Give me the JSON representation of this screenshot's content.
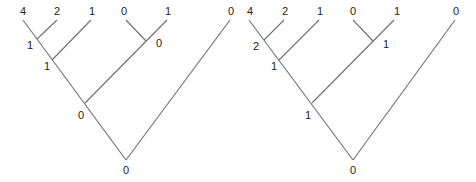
{
  "trees": [
    {
      "name": "left-tree",
      "leaves": [
        "4",
        "2",
        "1",
        "0",
        "1",
        "0"
      ],
      "internal_nodes": {
        "n42": "1",
        "n421": "1",
        "n01": "0",
        "n_left": "0",
        "root": "0"
      }
    },
    {
      "name": "right-tree",
      "leaves": [
        "4",
        "2",
        "1",
        "0",
        "1",
        "0"
      ],
      "internal_nodes": {
        "n42": "2",
        "n421": "1",
        "n01": "1",
        "n_left": "1",
        "root": "0"
      }
    }
  ],
  "colors": {
    "edge": "#6f6f6f",
    "label": "#222222"
  }
}
